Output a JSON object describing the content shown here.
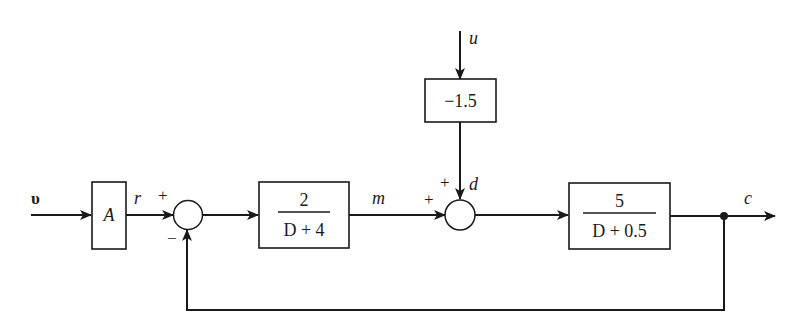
{
  "diagram": {
    "type": "control-block-diagram",
    "signals": {
      "input": "υ",
      "reference": "r",
      "manipulated": "m",
      "disturbance_input": "u",
      "disturbance": "d",
      "output": "c"
    },
    "blocks": {
      "gain_a": {
        "label": "A"
      },
      "controller": {
        "numerator": "2",
        "denominator": "D + 4"
      },
      "disturbance_gain": {
        "label": "−1.5"
      },
      "plant": {
        "numerator": "5",
        "denominator": "D + 0.5"
      }
    },
    "summing_junctions": {
      "error_sum": {
        "top_sign": "+",
        "bottom_sign": "−"
      },
      "disturbance_sum": {
        "left_sign": "+",
        "top_sign": "+"
      }
    },
    "connections": [
      "υ → A",
      "A → r → error_sum(+)",
      "error_sum → 2/(D+4)",
      "2/(D+4) → m → disturbance_sum(+)",
      "u → −1.5 → d → disturbance_sum(+)",
      "disturbance_sum → 5/(D+0.5)",
      "5/(D+0.5) → c",
      "c → feedback → error_sum(−)"
    ]
  }
}
